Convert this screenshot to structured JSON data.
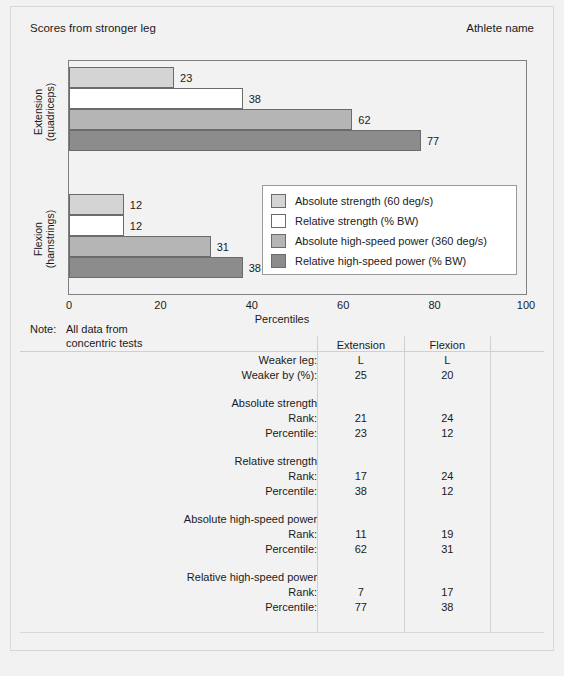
{
  "header": {
    "left_title": "Scores from stronger leg",
    "right_title": "Athlete name"
  },
  "note": {
    "label": "Note:",
    "line1": "All data from",
    "line2": "concentric tests"
  },
  "colors": {
    "absolute_strength": "#d4d4d4",
    "relative_strength": "#ffffff",
    "absolute_high_speed_power": "#b5b5b5",
    "relative_high_speed_power": "#8c8c8c",
    "bar_outline": "#6b6b6b",
    "plot_background": "#f2f2f2",
    "page_background": "#f2f2f2"
  },
  "chart_data": {
    "type": "bar",
    "orientation": "horizontal",
    "title": "Scores from stronger leg",
    "xlabel": "Percentiles",
    "ylabel": "",
    "xlim": [
      0,
      100
    ],
    "xticks": [
      0,
      20,
      40,
      60,
      80,
      100
    ],
    "grid": false,
    "legend_position": "inside-right",
    "categories": [
      "Extension (quadriceps)",
      "Flexion (hamstrings)"
    ],
    "category_lines": [
      [
        "Extension",
        "(quadriceps)"
      ],
      [
        "Flexion",
        "(hamstrings)"
      ]
    ],
    "series": [
      {
        "name": "Absolute strength (60 deg/s)",
        "color": "#d4d4d4",
        "values": [
          23,
          12
        ]
      },
      {
        "name": "Relative strength (% BW)",
        "color": "#ffffff",
        "values": [
          38,
          12
        ]
      },
      {
        "name": "Absolute high-speed power (360 deg/s)",
        "color": "#b5b5b5",
        "values": [
          62,
          31
        ]
      },
      {
        "name": "Relative high-speed power (% BW)",
        "color": "#8c8c8c",
        "values": [
          77,
          38
        ]
      }
    ],
    "bar_labels": [
      [
        "23",
        "38",
        "62",
        "77"
      ],
      [
        "12",
        "12",
        "31",
        "38"
      ]
    ]
  },
  "legend": {
    "items": [
      {
        "label": "Absolute strength (60 deg/s)",
        "color": "#d4d4d4"
      },
      {
        "label": "Relative strength (% BW)",
        "color": "#ffffff"
      },
      {
        "label": "Absolute high-speed power (360 deg/s)",
        "color": "#b5b5b5"
      },
      {
        "label": "Relative high-speed power (% BW)",
        "color": "#8c8c8c"
      }
    ]
  },
  "table": {
    "columns": [
      "",
      "Extension",
      "Flexion"
    ],
    "col_extension": "Extension",
    "col_flexion": "Flexion",
    "rows": [
      {
        "label": "Weaker leg:",
        "extension": "L",
        "flexion": "L"
      },
      {
        "label": "Weaker by (%):",
        "extension": "25",
        "flexion": "20"
      }
    ],
    "sections": [
      {
        "heading": "Absolute strength",
        "rows": [
          {
            "label": "Rank:",
            "extension": "21",
            "flexion": "24"
          },
          {
            "label": "Percentile:",
            "extension": "23",
            "flexion": "12"
          }
        ]
      },
      {
        "heading": "Relative strength",
        "rows": [
          {
            "label": "Rank:",
            "extension": "17",
            "flexion": "24"
          },
          {
            "label": "Percentile:",
            "extension": "38",
            "flexion": "12"
          }
        ]
      },
      {
        "heading": "Absolute high-speed power",
        "rows": [
          {
            "label": "Rank:",
            "extension": "11",
            "flexion": "19"
          },
          {
            "label": "Percentile:",
            "extension": "62",
            "flexion": "31"
          }
        ]
      },
      {
        "heading": "Relative high-speed power",
        "rows": [
          {
            "label": "Rank:",
            "extension": "7",
            "flexion": "17"
          },
          {
            "label": "Percentile:",
            "extension": "77",
            "flexion": "38"
          }
        ]
      }
    ]
  }
}
